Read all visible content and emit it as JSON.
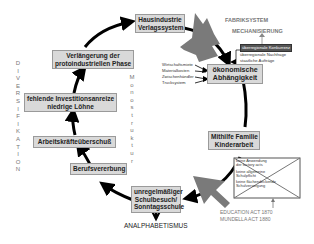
{
  "cycle_boxes": {
    "hausindustrie": [
      "Hausindustrie",
      "Verlagssystem"
    ],
    "oekonomisch": [
      "ökonomische",
      "Abhängigkeit"
    ],
    "mithilfe": [
      "Mithilfe Familie",
      "Kinderarbeit"
    ],
    "schulbesuch": [
      "unregelmäßiger",
      "Schulbesuch/",
      "Sonntagsschule"
    ],
    "berufsvererbung": [
      "Berufsvererbung"
    ],
    "arbeitskraefte": [
      "Arbeitskräfteüberschuß"
    ],
    "investition": [
      "fehlende Investitionsanreize",
      "niedrige Löhne"
    ],
    "verlaengerung": [
      "Verlängerung der",
      "protoindustriellen Phase"
    ]
  },
  "side_labels": {
    "diversifikation": [
      "D",
      "I",
      "V",
      "E",
      "R",
      "S",
      "I",
      "F",
      "I",
      "K",
      "A",
      "T",
      "I",
      "O",
      "N"
    ],
    "monostruktur": [
      "M",
      "o",
      "n",
      "o",
      "s",
      "t",
      "r",
      "u",
      "k",
      "t",
      "u",
      "r"
    ]
  },
  "external": {
    "fabriksystem": "FABRIKSYSTEM",
    "mechanisierung": "MECHANISIERUNG",
    "markets": [
      "überregionale Konkurrenz",
      "überregionale Nachfrage",
      "staatliche Aufträge"
    ],
    "dependency_causes": [
      "Wirtschaftsmiete",
      "Materialkosten",
      "Zwischenhändler",
      "Trucksystem"
    ],
    "school_crossed": [
      "keine Anwendung",
      "der factory acts",
      "keine allgemeine",
      "Schulpflicht",
      "keine flächendeckende",
      "Schulversorgung"
    ],
    "education_acts": [
      "EDUCATION ACT 1870",
      "MUNDELLA ACT 1880"
    ],
    "analphabetismus": "ANALPHABETISMUS"
  },
  "colors": {
    "box_fill": "#d9d9d9",
    "box_border": "#9a9a9a",
    "arrow": "#000000",
    "big_arrow": "#7a7a7a",
    "gray_text": "#777777"
  }
}
